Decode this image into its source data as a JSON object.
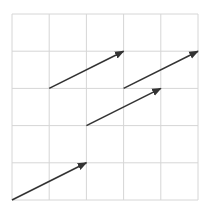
{
  "diagram": {
    "type": "vector-grid",
    "grid": {
      "cols": 5,
      "rows": 5,
      "origin_px": [
        12,
        200
      ],
      "cell_px": 37.2,
      "line_color": "#d6d6d6"
    },
    "arrow_color": "#333333",
    "arrows": [
      {
        "from": [
          0,
          0
        ],
        "to": [
          2,
          1
        ]
      },
      {
        "from": [
          2,
          2
        ],
        "to": [
          4,
          3
        ]
      },
      {
        "from": [
          1,
          3
        ],
        "to": [
          3,
          4
        ]
      },
      {
        "from": [
          3,
          3
        ],
        "to": [
          5,
          4
        ]
      }
    ]
  }
}
